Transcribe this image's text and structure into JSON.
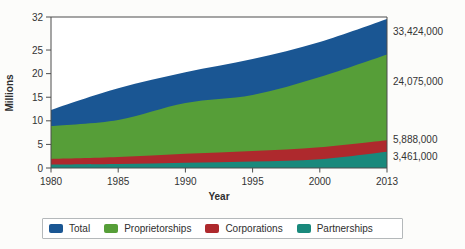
{
  "figure": {
    "background": "#fcfcfa",
    "plot_background": "#ffffff",
    "axis_color": "#4d4d4d",
    "text_color": "#333333"
  },
  "chart_data": {
    "type": "area",
    "title": "",
    "xlabel": "Year",
    "ylabel": "Millions",
    "x": [
      1980,
      1985,
      1990,
      1995,
      2000,
      2013
    ],
    "x_tick_labels": [
      "1980",
      "1985",
      "1990",
      "1995",
      "2000",
      "2013"
    ],
    "y_ticks": [
      32,
      25,
      20,
      15,
      10,
      5,
      0
    ],
    "ylim": [
      0,
      32
    ],
    "grid": false,
    "legend_position": "bottom",
    "series": [
      {
        "name": "Total",
        "color": "#1a5693",
        "values_millions": [
          12.3,
          16.9,
          20.3,
          23.1,
          26.7,
          33.42
        ],
        "end_value": 33424000,
        "end_label": "33,424,000"
      },
      {
        "name": "Proprietorships",
        "color": "#569e38",
        "values_millions": [
          8.9,
          10.2,
          13.8,
          15.5,
          19.3,
          24.08
        ],
        "end_value": 24075000,
        "end_label": "24,075,000"
      },
      {
        "name": "Corporations",
        "color": "#ae292d",
        "values_millions": [
          1.9,
          2.3,
          3.0,
          3.6,
          4.4,
          5.89
        ],
        "end_value": 5888000,
        "end_label": "5,888,000"
      },
      {
        "name": "Partnerships",
        "color": "#19897c",
        "values_millions": [
          0.75,
          0.85,
          1.1,
          1.35,
          1.85,
          3.46
        ],
        "end_value": 3461000,
        "end_label": "3,461,000"
      }
    ]
  },
  "legend": {
    "items": [
      {
        "label": "Total",
        "color": "#1a5693"
      },
      {
        "label": "Proprietorships",
        "color": "#569e38"
      },
      {
        "label": "Corporations",
        "color": "#ae292d"
      },
      {
        "label": "Partnerships",
        "color": "#19897c"
      }
    ]
  }
}
